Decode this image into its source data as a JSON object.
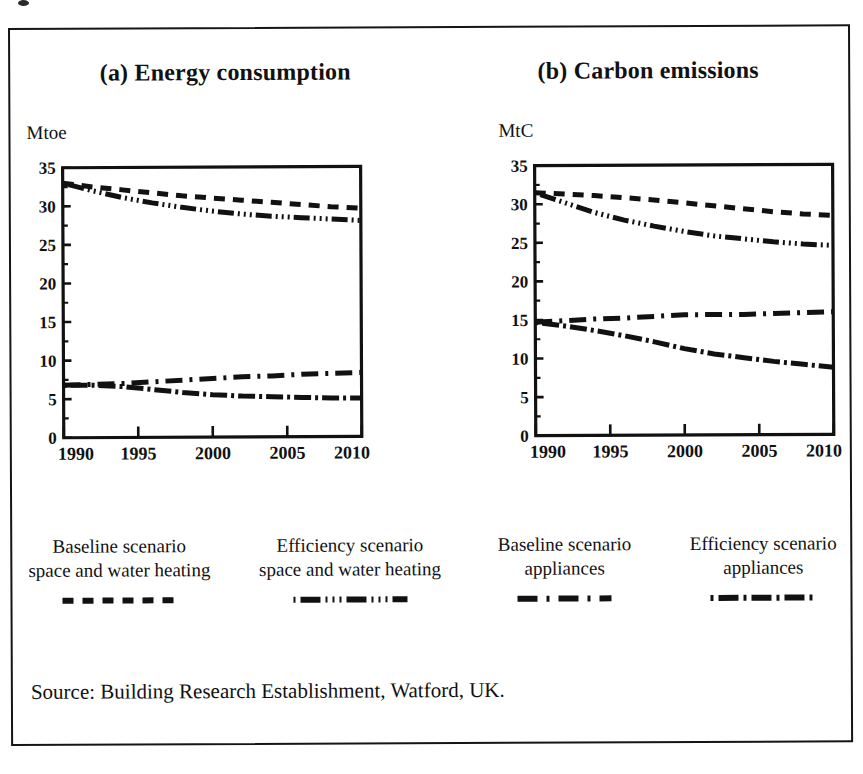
{
  "figure": {
    "source_note": "Source: Building Research Establishment, Watford, UK.",
    "frame_color": "#151515",
    "ink_color": "#111111"
  },
  "panels": [
    {
      "id": "a",
      "title": "(a) Energy consumption",
      "unit_label": "Mtoe"
    },
    {
      "id": "b",
      "title": "(b) Carbon emissions",
      "unit_label": "MtC"
    }
  ],
  "legend": {
    "items": [
      {
        "line1": "Baseline scenario",
        "line2": "space and water heating",
        "style": "dashed",
        "swatch_name": "dashed-line-swatch"
      },
      {
        "line1": "Efficiency scenario",
        "line2": "space and water heating",
        "style": "dash-dot-dot",
        "swatch_name": "dash-dot-dot-line-swatch"
      },
      {
        "line1": "Baseline scenario",
        "line2": "appliances",
        "style": "long-dash-dot",
        "swatch_name": "long-dash-dot-line-swatch"
      },
      {
        "line1": "Efficiency scenario",
        "line2": "appliances",
        "style": "dash-dot",
        "swatch_name": "dash-dot-line-swatch"
      }
    ]
  },
  "chart_data": [
    {
      "type": "line",
      "title": "(a) Energy consumption",
      "xlabel": "",
      "ylabel": "Mtoe",
      "xlim": [
        1990,
        2010
      ],
      "ylim": [
        0,
        35
      ],
      "yticks": [
        0,
        5,
        10,
        15,
        20,
        25,
        30,
        35
      ],
      "ytick_labels": [
        "0",
        "5",
        "10",
        "15",
        "20",
        "25",
        "30",
        "35"
      ],
      "xticks": [
        1990,
        1995,
        2000,
        2005,
        2010
      ],
      "xtick_labels": [
        "1990",
        "1995",
        "2000",
        "2005",
        "2010"
      ],
      "minor_yticks": [
        2.5,
        7.5,
        12.5,
        17.5,
        22.5,
        27.5,
        32.5
      ],
      "grid": false,
      "legend_position": "below-figure",
      "x": [
        1990,
        1992,
        1994,
        1996,
        1998,
        2000,
        2002,
        2004,
        2006,
        2008,
        2010
      ],
      "series": [
        {
          "name": "Baseline scenario space and water heating",
          "style": "dashed",
          "values": [
            33.0,
            32.5,
            32.1,
            31.7,
            31.3,
            31.0,
            30.7,
            30.4,
            30.1,
            29.8,
            29.6
          ]
        },
        {
          "name": "Efficiency scenario space and water heating",
          "style": "dash-dot-dot",
          "values": [
            33.0,
            32.0,
            31.1,
            30.4,
            29.8,
            29.3,
            28.9,
            28.6,
            28.4,
            28.2,
            28.0
          ]
        },
        {
          "name": "Baseline scenario appliances",
          "style": "long-dash-dot",
          "values": [
            6.8,
            6.9,
            7.0,
            7.2,
            7.4,
            7.6,
            7.8,
            7.9,
            8.1,
            8.2,
            8.3
          ]
        },
        {
          "name": "Efficiency scenario appliances",
          "style": "dash-dot",
          "values": [
            6.8,
            6.8,
            6.6,
            6.2,
            5.8,
            5.5,
            5.3,
            5.2,
            5.1,
            5.0,
            5.0
          ]
        }
      ]
    },
    {
      "type": "line",
      "title": "(b) Carbon emissions",
      "xlabel": "",
      "ylabel": "MtC",
      "xlim": [
        1990,
        2010
      ],
      "ylim": [
        0,
        35
      ],
      "yticks": [
        0,
        5,
        10,
        15,
        20,
        25,
        30,
        35
      ],
      "ytick_labels": [
        "0",
        "5",
        "10",
        "15",
        "20",
        "25",
        "30",
        "35"
      ],
      "xticks": [
        1990,
        1995,
        2000,
        2005,
        2010
      ],
      "xtick_labels": [
        "1990",
        "1995",
        "2000",
        "2005",
        "2010"
      ],
      "minor_yticks": [
        2.5,
        7.5,
        12.5,
        17.5,
        22.5,
        27.5,
        32.5
      ],
      "grid": false,
      "legend_position": "below-figure",
      "x": [
        1990,
        1992,
        1994,
        1996,
        1998,
        2000,
        2002,
        2004,
        2006,
        2008,
        2010
      ],
      "series": [
        {
          "name": "Baseline scenario space and water heating",
          "style": "dashed",
          "values": [
            31.5,
            31.3,
            31.1,
            30.8,
            30.5,
            30.1,
            29.7,
            29.3,
            28.9,
            28.6,
            28.4
          ]
        },
        {
          "name": "Efficiency scenario space and water heating",
          "style": "dash-dot-dot",
          "values": [
            31.5,
            30.2,
            28.9,
            27.9,
            27.1,
            26.4,
            25.8,
            25.4,
            25.0,
            24.7,
            24.5
          ]
        },
        {
          "name": "Baseline scenario appliances",
          "style": "long-dash-dot",
          "values": [
            14.7,
            14.9,
            15.1,
            15.2,
            15.4,
            15.6,
            15.6,
            15.6,
            15.7,
            15.8,
            15.9
          ]
        },
        {
          "name": "Efficiency scenario appliances",
          "style": "dash-dot",
          "values": [
            14.7,
            14.2,
            13.6,
            12.9,
            12.1,
            11.2,
            10.5,
            10.0,
            9.5,
            9.1,
            8.7
          ]
        }
      ]
    }
  ]
}
